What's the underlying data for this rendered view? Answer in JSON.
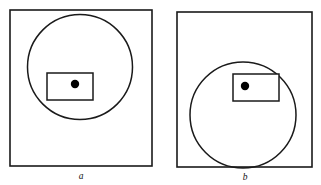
{
  "figure": {
    "caption_labels": [
      "a",
      "b"
    ],
    "stroke_color": "#1a1a1a",
    "dot_color": "#000000",
    "background_color": "#ffffff",
    "panels": [
      {
        "id": "a",
        "label": "a",
        "label_x": 81,
        "label_y": 179,
        "square": {
          "x": 10,
          "y": 10,
          "width": 142,
          "height": 156
        },
        "circle": {
          "cx": 80,
          "cy": 67,
          "r": 52.5
        },
        "rectangle": {
          "x": 47,
          "y": 73,
          "width": 46,
          "height": 27
        },
        "dot": {
          "cx": 75,
          "cy": 84,
          "r": 4.2
        }
      },
      {
        "id": "b",
        "label": "b",
        "label_x": 245,
        "label_y": 180,
        "square": {
          "x": 177,
          "y": 12,
          "width": 135,
          "height": 155
        },
        "circle": {
          "cx": 243,
          "cy": 115,
          "r": 53
        },
        "rectangle": {
          "x": 233,
          "y": 74,
          "width": 46,
          "height": 27
        },
        "dot": {
          "cx": 245,
          "cy": 86,
          "r": 4.2
        }
      }
    ]
  }
}
